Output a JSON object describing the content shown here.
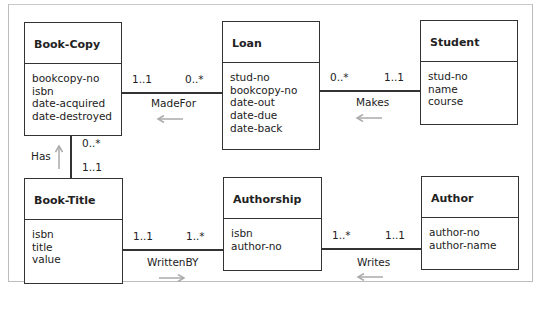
{
  "entities": [
    {
      "id": "book-copy",
      "name": "Book-Copy",
      "attributes": [
        "bookcopy-no",
        "isbn",
        "date-acquired",
        "date-destroyed"
      ]
    },
    {
      "id": "loan",
      "name": "Loan",
      "attributes": [
        "stud-no",
        "bookcopy-no",
        "date-out",
        "date-due",
        "date-back"
      ]
    },
    {
      "id": "student",
      "name": "Student",
      "attributes": [
        "stud-no",
        "name",
        "course"
      ]
    },
    {
      "id": "book-title",
      "name": "Book-Title",
      "attributes": [
        "isbn",
        "title",
        "value"
      ]
    },
    {
      "id": "authorship",
      "name": "Authorship",
      "attributes": [
        "isbn",
        "author-no"
      ]
    },
    {
      "id": "author",
      "name": "Author",
      "attributes": [
        "author-no",
        "author-name"
      ]
    }
  ],
  "relationships": [
    {
      "name": "MadeFor",
      "from": "Loan",
      "to": "Book-Copy",
      "left_mult": "1..1",
      "right_mult": "0..*",
      "arrow": "left"
    },
    {
      "name": "Makes",
      "from": "Student",
      "to": "Loan",
      "left_mult": "0..*",
      "right_mult": "1..1",
      "arrow": "left"
    },
    {
      "name": "Has",
      "from": "Book-Title",
      "to": "Book-Copy",
      "top_mult": "0..*",
      "bottom_mult": "1..1",
      "arrow": "up"
    },
    {
      "name": "WrittenBY",
      "from": "Book-Title",
      "to": "Authorship",
      "left_mult": "1..1",
      "right_mult": "1..*",
      "arrow": "right"
    },
    {
      "name": "Writes",
      "from": "Author",
      "to": "Authorship",
      "left_mult": "1..*",
      "right_mult": "1..1",
      "arrow": "left"
    }
  ],
  "colors": {
    "line": "#333333",
    "arrow": "#aaaaaa",
    "frame": "#bdbdbd"
  }
}
